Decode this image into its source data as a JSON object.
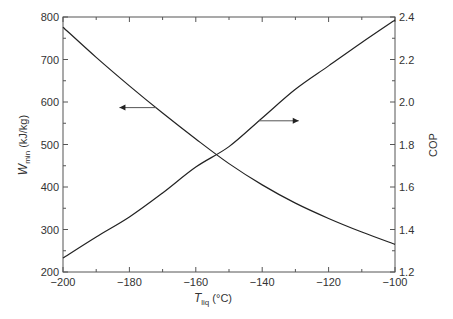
{
  "chart_data": {
    "type": "line",
    "title": "",
    "xlabel": {
      "main": "T",
      "sub": "liq",
      "unit": " (°C)"
    },
    "ylabel_left": {
      "main": "W",
      "sub": "min",
      "unit": " (kJ/kg)"
    },
    "ylabel_right": "COP",
    "xlim": [
      -200,
      -100
    ],
    "ylim_left": [
      200,
      800
    ],
    "ylim_right": [
      1.2,
      2.4
    ],
    "x_ticks": [
      -200,
      -180,
      -160,
      -140,
      -120,
      -100
    ],
    "x_tick_labels": [
      "−200",
      "−180",
      "−160",
      "−140",
      "−120",
      "−100"
    ],
    "y_left_ticks": [
      200,
      300,
      400,
      500,
      600,
      700,
      800
    ],
    "y_left_tick_labels": [
      "200",
      "300",
      "400",
      "500",
      "600",
      "700",
      "800"
    ],
    "y_right_ticks": [
      1.2,
      1.4,
      1.6,
      1.8,
      2.0,
      2.2,
      2.4
    ],
    "y_right_tick_labels": [
      "1.2",
      "1.4",
      "1.6",
      "1.8",
      "2.0",
      "2.2",
      "2.4"
    ],
    "grid": false,
    "x": [
      -200,
      -190,
      -180,
      -170,
      -160,
      -150,
      -140,
      -130,
      -120,
      -110,
      -100
    ],
    "series": [
      {
        "name": "Wmin",
        "axis": "left",
        "values": [
          776,
          705,
          638,
          574,
          513,
          455,
          405,
          362,
          326,
          294,
          265
        ]
      },
      {
        "name": "COP",
        "axis": "right",
        "values": [
          1.266,
          1.365,
          1.459,
          1.572,
          1.694,
          1.79,
          1.925,
          2.06,
          2.17,
          2.28,
          2.386
        ]
      }
    ],
    "annotations": [
      {
        "type": "arrow",
        "direction": "left",
        "series": "Wmin",
        "from_x": -172,
        "to_x": -183
      },
      {
        "type": "arrow",
        "direction": "right",
        "series": "COP",
        "from_x": -141,
        "to_x": -129
      }
    ]
  }
}
